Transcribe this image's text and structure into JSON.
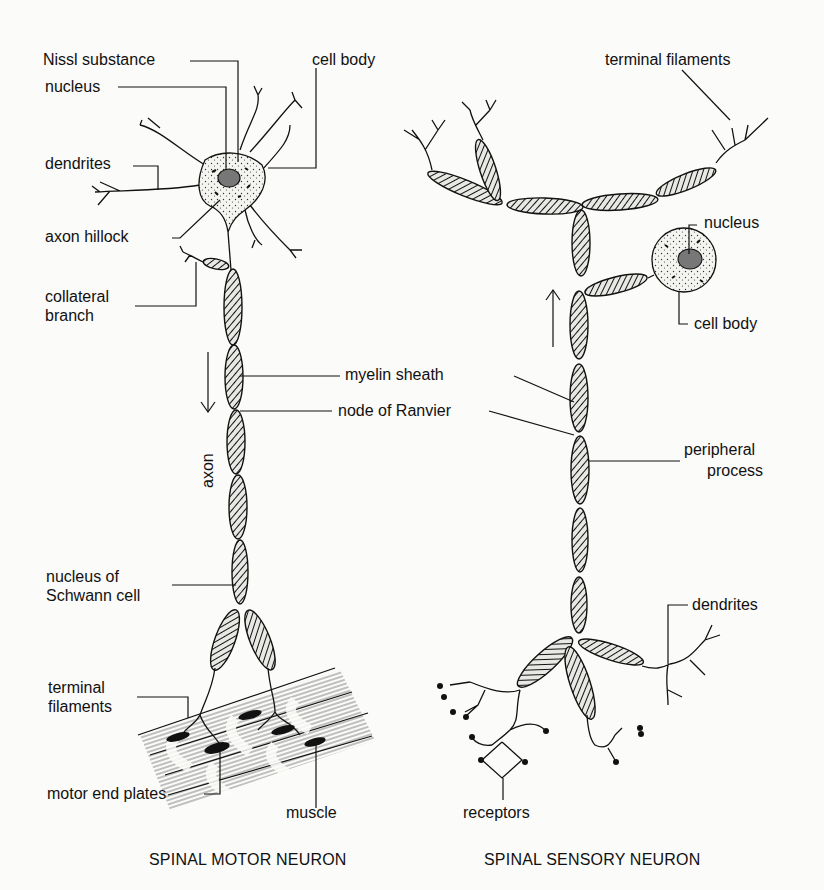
{
  "motor_neuron": {
    "title": "SPINAL MOTOR NEURON",
    "labels": {
      "nissl_substance": "Nissl substance",
      "nucleus": "nucleus",
      "cell_body": "cell body",
      "dendrites": "dendrites",
      "axon_hillock": "axon hillock",
      "collateral_branch_1": "collateral",
      "collateral_branch_2": "branch",
      "myelin_sheath": "myelin sheath",
      "node_of_ranvier": "node of Ranvier",
      "axon": "axon",
      "schwann_1": "nucleus of",
      "schwann_2": "Schwann cell",
      "terminal_filaments_1": "terminal",
      "terminal_filaments_2": "filaments",
      "motor_end_plates": "motor end plates",
      "muscle": "muscle"
    },
    "signal_direction": "down-arrow"
  },
  "sensory_neuron": {
    "title": "SPINAL SENSORY NEURON",
    "labels": {
      "terminal_filaments": "terminal filaments",
      "nucleus": "nucleus",
      "cell_body": "cell body",
      "peripheral_process_1": "peripheral",
      "peripheral_process_2": "process",
      "dendrites": "dendrites",
      "receptors": "receptors"
    },
    "signal_direction": "up-arrow"
  }
}
